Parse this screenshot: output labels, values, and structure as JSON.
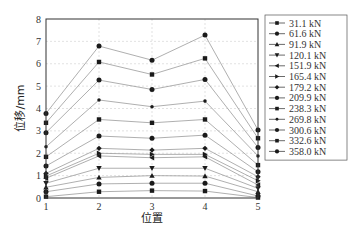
{
  "chart_data": {
    "type": "line",
    "title": "",
    "xlabel": "位置",
    "ylabel": "位移/mm",
    "x": [
      1,
      2,
      3,
      4,
      5
    ],
    "xlim": [
      1,
      5
    ],
    "ylim": [
      0,
      8
    ],
    "yticks": [
      0,
      1,
      2,
      3,
      4,
      5,
      6,
      7,
      8
    ],
    "xticks": [
      1,
      2,
      3,
      4,
      5
    ],
    "grid": true,
    "legend_position": "right",
    "series": [
      {
        "name": "31.1 kN",
        "marker": "square",
        "values": [
          0.06,
          0.28,
          0.33,
          0.31,
          0.02
        ]
      },
      {
        "name": "61.6 kN",
        "marker": "circle",
        "values": [
          0.28,
          0.63,
          0.66,
          0.66,
          0.09
        ]
      },
      {
        "name": "91.9 kN",
        "marker": "triangle-up",
        "values": [
          0.48,
          0.92,
          1.0,
          0.98,
          0.28
        ]
      },
      {
        "name": "120.1 kN",
        "marker": "triangle-down",
        "values": [
          0.66,
          1.33,
          1.33,
          1.33,
          0.43
        ]
      },
      {
        "name": "151.9 kN",
        "marker": "triangle-left",
        "values": [
          0.88,
          1.88,
          1.8,
          1.84,
          0.58
        ]
      },
      {
        "name": "165.4 kN",
        "marker": "triangle-right",
        "values": [
          0.98,
          2.0,
          1.95,
          1.95,
          0.77
        ]
      },
      {
        "name": "179.2 kN",
        "marker": "diamond",
        "values": [
          1.1,
          2.22,
          2.14,
          2.22,
          0.95
        ]
      },
      {
        "name": "209.9 kN",
        "marker": "circle",
        "values": [
          1.43,
          2.77,
          2.67,
          2.81,
          1.17
        ]
      },
      {
        "name": "238.3 kN",
        "marker": "square",
        "values": [
          1.84,
          3.51,
          3.36,
          3.51,
          1.47
        ]
      },
      {
        "name": "269.8 kN",
        "marker": "star",
        "values": [
          2.29,
          4.38,
          4.08,
          4.33,
          1.88
        ]
      },
      {
        "name": "300.6 kN",
        "marker": "circle",
        "values": [
          2.92,
          5.27,
          4.85,
          5.3,
          2.26
        ]
      },
      {
        "name": "332.6 kN",
        "marker": "square",
        "values": [
          3.36,
          6.08,
          5.52,
          6.24,
          2.67
        ]
      },
      {
        "name": "358.0 kN",
        "marker": "circle",
        "values": [
          3.78,
          6.79,
          6.16,
          7.28,
          3.04
        ]
      }
    ]
  },
  "colors": {
    "line": "#9a9a9a",
    "marker": "#1a1a1a",
    "axis": "#333333",
    "grid": "#cfcfcf"
  }
}
